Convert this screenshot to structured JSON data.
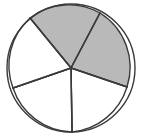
{
  "figure": {
    "name": "pie-circle-sectors",
    "background_color": "#ffffff",
    "stroke_color": "#3a3a3a",
    "stroke_width": 1.4,
    "shaded_fill": "#b9b9b9",
    "unshaded_fill": "#ffffff"
  },
  "chart_data": {
    "type": "pie",
    "title": "",
    "xlabel": "",
    "ylabel": "",
    "center": {
      "cx": 71,
      "cy": 68
    },
    "radius": 64,
    "legend": "none",
    "grid": false,
    "categories": [
      "sector-top-left-shaded",
      "sector-right-shaded",
      "sector-bottom-right",
      "sector-bottom-left",
      "sector-left"
    ],
    "values": [
      20,
      20,
      20,
      20,
      20
    ],
    "sectors": [
      {
        "name": "sector-top-left-shaded",
        "shaded": true,
        "fill": "#b9b9b9",
        "start_angle_deg": -130,
        "end_angle_deg": -62,
        "edge_point_start": {
          "x": 30,
          "y": 18
        },
        "edge_point_end": {
          "x": 100,
          "y": 13
        }
      },
      {
        "name": "sector-right-shaded",
        "shaded": true,
        "fill": "#b9b9b9",
        "start_angle_deg": -62,
        "end_angle_deg": 17,
        "edge_point_start": {
          "x": 100,
          "y": 13
        },
        "edge_point_end": {
          "x": 127,
          "y": 87
        }
      },
      {
        "name": "sector-bottom-right",
        "shaded": false,
        "fill": "#ffffff",
        "start_angle_deg": 17,
        "end_angle_deg": 89,
        "edge_point_start": {
          "x": 127,
          "y": 87
        },
        "edge_point_end": {
          "x": 72,
          "y": 132
        }
      },
      {
        "name": "sector-bottom-left",
        "shaded": false,
        "fill": "#ffffff",
        "start_angle_deg": 89,
        "end_angle_deg": 161,
        "edge_point_start": {
          "x": 72,
          "y": 132
        },
        "edge_point_end": {
          "x": 13,
          "y": 88
        }
      },
      {
        "name": "sector-left",
        "shaded": false,
        "fill": "#ffffff",
        "start_angle_deg": 161,
        "end_angle_deg": 230,
        "edge_point_start": {
          "x": 13,
          "y": 88
        },
        "edge_point_end": {
          "x": 30,
          "y": 18
        }
      }
    ],
    "radii_lines": [
      {
        "name": "radius-upper-left",
        "x2": 30,
        "y2": 18
      },
      {
        "name": "radius-upper-right",
        "x2": 100,
        "y2": 13
      },
      {
        "name": "radius-right",
        "x2": 127,
        "y2": 87
      },
      {
        "name": "radius-bottom",
        "x2": 72,
        "y2": 132
      },
      {
        "name": "radius-lower-left",
        "x2": 13,
        "y2": 88
      }
    ]
  }
}
